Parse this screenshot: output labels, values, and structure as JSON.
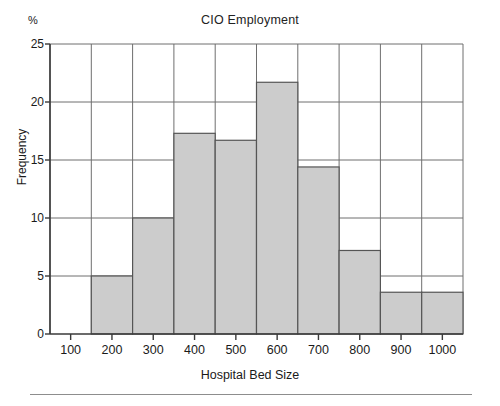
{
  "figure": {
    "unit_label": "%",
    "title": "CIO Employment",
    "xlabel": "Hospital Bed Size",
    "ylabel": "Frequency"
  },
  "colors": {
    "bar_fill": "#cccccc",
    "bar_stroke": "#555555",
    "axis": "#3a3a3a",
    "grid": "#6e6e6e",
    "text": "#1a1a1a",
    "rule": "#8d8d8d"
  },
  "chart_data": {
    "type": "bar",
    "title": "CIO Employment",
    "xlabel": "Hospital Bed Size",
    "ylabel": "Frequency",
    "unit": "%",
    "xlim": [
      50,
      1050
    ],
    "ylim": [
      0,
      25
    ],
    "yticks": [
      0,
      5,
      10,
      15,
      20,
      25
    ],
    "xticks": [
      100,
      200,
      300,
      400,
      500,
      600,
      700,
      800,
      900,
      1000
    ],
    "grid": true,
    "legend": null,
    "bin_width": 100,
    "bin_edges": [
      50,
      150,
      250,
      350,
      450,
      550,
      650,
      750,
      850,
      950,
      1050
    ],
    "categories": [
      "50-150",
      "150-250",
      "250-350",
      "350-450",
      "450-550",
      "550-650",
      "650-750",
      "750-850",
      "850-950",
      "950-1050"
    ],
    "bin_centers": [
      100,
      200,
      300,
      400,
      500,
      600,
      700,
      800,
      900,
      1000
    ],
    "values": [
      0,
      5.0,
      10.0,
      17.3,
      16.7,
      21.7,
      14.4,
      7.2,
      3.6,
      3.6
    ]
  }
}
